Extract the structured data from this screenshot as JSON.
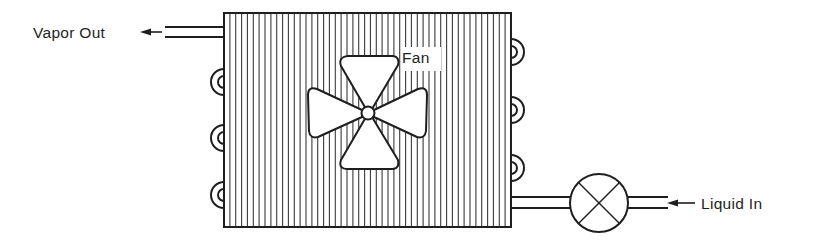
{
  "diagram": {
    "type": "condenser-schematic",
    "labels": {
      "vapor_out": "Vapor Out",
      "fan": "Fan",
      "liquid_in": "Liquid In"
    },
    "components": {
      "condenser_coil": {
        "fin_count": 48,
        "left_return_bends": 3,
        "right_return_bends": 3
      },
      "fan": {
        "blades": 4
      },
      "expansion_valve": {
        "symbol": "circle-with-x"
      }
    },
    "colors": {
      "line": "#1e1e1e",
      "fin": "#3a3a3a",
      "background": "#ffffff"
    }
  }
}
